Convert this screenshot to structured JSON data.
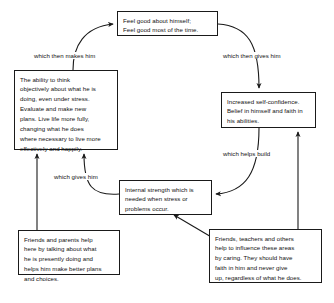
{
  "diagram": {
    "stroke_color": "#1a1a1a",
    "text_color": "#111111",
    "background_color": "#ffffff",
    "nodes": [
      {
        "id": "feel-good",
        "name": "feel-good-box",
        "lines": [
          "Feel good about himself;",
          "Feel good most of the time."
        ]
      },
      {
        "id": "ability",
        "name": "ability-to-think-box",
        "lines": [
          "The ability to think",
          "objectively about what he is",
          "doing, even under stress.",
          "Evaluate and make new",
          "plans. Live life more fully,",
          "changing what he does",
          "where necessary to live more",
          "effectively and happily."
        ]
      },
      {
        "id": "confidence",
        "name": "increased-self-confidence-box",
        "lines": [
          "Increased self-confidence.",
          "Belief in himself and faith in",
          "his abilities."
        ]
      },
      {
        "id": "internal",
        "name": "internal-strength-box",
        "lines": [
          "Internal strength which is",
          "needed when stress or",
          "problems occur."
        ]
      },
      {
        "id": "friends-parents",
        "name": "friends-and-parents-box",
        "lines": [
          "Friends and parents help",
          "here by talking about what",
          "he is presently doing and",
          "helps him make better plans",
          "and choices."
        ]
      },
      {
        "id": "friends-teachers",
        "name": "friends-teachers-others-box",
        "lines": [
          "Friends, teachers and others",
          "help to influence these areas",
          "by caring. They should have",
          "faith in him and never give",
          "up, regardless of what he does."
        ]
      }
    ],
    "edge_labels": [
      {
        "id": "makes-him",
        "text": "which then makes him"
      },
      {
        "id": "gives-him-2",
        "text": "which then gives him"
      },
      {
        "id": "gives-him",
        "text": "which gives him"
      },
      {
        "id": "helps-build",
        "text": "which helps build"
      }
    ]
  }
}
